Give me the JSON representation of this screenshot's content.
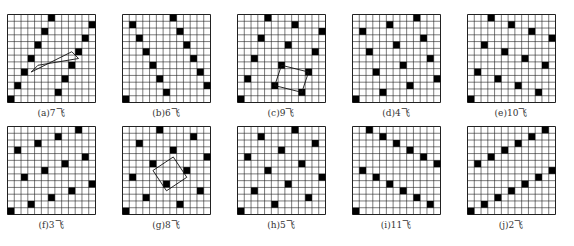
{
  "caption_fragment": "……图中所示的是若干种马步（飞）构型……",
  "grid": {
    "size": 13,
    "line_color": "#222222",
    "dot_color": "#000000",
    "background": "#ffffff"
  },
  "panels": [
    {
      "id": "a",
      "label": "(a)7飞",
      "step": 7,
      "x": 7,
      "y": 14,
      "quad": [
        [
          3,
          4
        ],
        [
          4,
          5
        ],
        [
          10,
          6
        ],
        [
          9,
          7
        ]
      ]
    },
    {
      "id": "b",
      "label": "(b)6飞",
      "step": 6,
      "x": 122,
      "y": 14,
      "quad": null
    },
    {
      "id": "c",
      "label": "(c)9飞",
      "step": 9,
      "x": 237,
      "y": 14,
      "quad": [
        [
          5,
          2
        ],
        [
          6,
          5
        ],
        [
          10,
          4
        ],
        [
          9,
          1
        ]
      ]
    },
    {
      "id": "d",
      "label": "(d)4飞",
      "step": 4,
      "x": 352,
      "y": 14,
      "quad": null
    },
    {
      "id": "e",
      "label": "(e)10飞",
      "step": 10,
      "x": 467,
      "y": 14,
      "quad": null
    },
    {
      "id": "f",
      "label": "(f)3飞",
      "step": 3,
      "x": 7,
      "y": 126,
      "quad": null
    },
    {
      "id": "g",
      "label": "(g)8飞",
      "step": 8,
      "x": 122,
      "y": 126,
      "quad": [
        [
          4,
          6
        ],
        [
          7,
          8
        ],
        [
          9,
          5
        ],
        [
          6,
          3
        ]
      ]
    },
    {
      "id": "h",
      "label": "(h)5飞",
      "step": 5,
      "x": 237,
      "y": 126,
      "quad": null
    },
    {
      "id": "i",
      "label": "(i)11飞",
      "step": 11,
      "x": 352,
      "y": 126,
      "quad": null
    },
    {
      "id": "j",
      "label": "(j)2飞",
      "step": 2,
      "x": 467,
      "y": 126,
      "quad": null
    }
  ]
}
